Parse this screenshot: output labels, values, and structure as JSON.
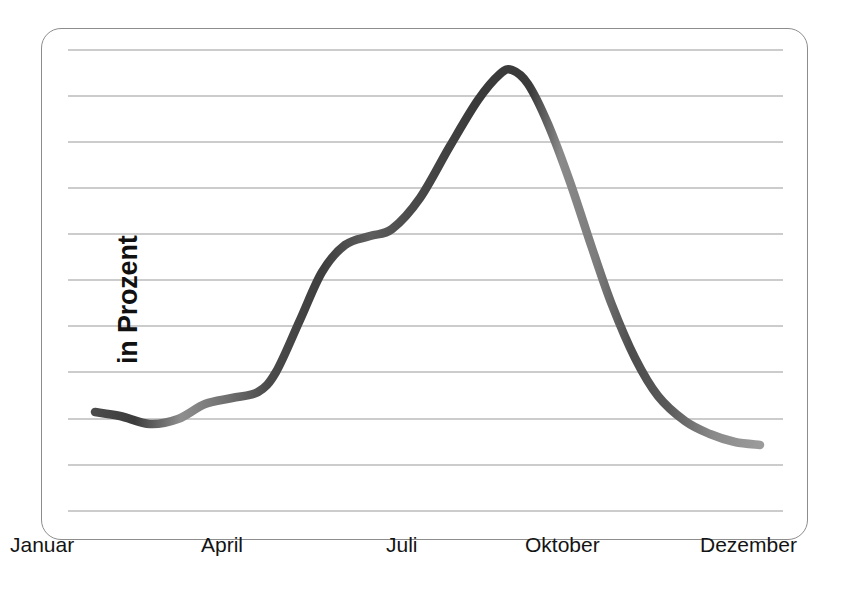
{
  "chart_data": {
    "type": "line",
    "title": "",
    "subtitle": "",
    "xlabel": "",
    "ylabel": "in Prozent",
    "grid": true,
    "gridlines": 11,
    "legend": "none",
    "annotations": [],
    "x_tick_labels": [
      "Januar",
      "April",
      "Juli",
      "Oktober",
      "Dezember"
    ],
    "x_tick_positions_px": [
      38,
      228,
      408,
      570,
      745
    ],
    "y_tick_labels": [],
    "ylim": [
      0,
      11
    ],
    "xlim": [
      "Januar",
      "Dezember"
    ],
    "series": [
      {
        "name": "Verlauf",
        "x": [
          "Januar",
          "Februar",
          "Maerz",
          "April",
          "Mai",
          "Juni",
          "Juli",
          "August",
          "September",
          "Oktober",
          "November",
          "Dezember"
        ],
        "values": [
          2.2,
          1.9,
          2.2,
          2.5,
          3.6,
          5.6,
          6.4,
          7.1,
          9.7,
          8.1,
          3.4,
          1.4
        ],
        "style": "smooth-thick-tapered",
        "color_start": "#3c3c3c",
        "color_end": "#8e8e8e"
      }
    ],
    "curve_points_px": [
      [
        95,
        412
      ],
      [
        120,
        416
      ],
      [
        150,
        424
      ],
      [
        178,
        419
      ],
      [
        205,
        404
      ],
      [
        232,
        398
      ],
      [
        258,
        392
      ],
      [
        276,
        372
      ],
      [
        300,
        320
      ],
      [
        322,
        272
      ],
      [
        345,
        245
      ],
      [
        370,
        236
      ],
      [
        392,
        229
      ],
      [
        420,
        198
      ],
      [
        450,
        146
      ],
      [
        478,
        100
      ],
      [
        500,
        74
      ],
      [
        512,
        70
      ],
      [
        528,
        84
      ],
      [
        548,
        124
      ],
      [
        570,
        182
      ],
      [
        592,
        248
      ],
      [
        612,
        305
      ],
      [
        635,
        358
      ],
      [
        658,
        396
      ],
      [
        685,
        421
      ],
      [
        710,
        434
      ],
      [
        735,
        442
      ],
      [
        760,
        445
      ]
    ]
  },
  "style": {
    "frame_border_color": "#8d8d8d",
    "gridline_color": "#9a9a9a",
    "background": "#ffffff",
    "text_color": "#141414",
    "curve_dark": "#3c3c3c",
    "curve_light": "#8e8e8e"
  },
  "axis": {
    "y_caption": "in Prozent",
    "x_ticks": [
      {
        "label": "Januar",
        "x": 10
      },
      {
        "label": "April",
        "x": 201
      },
      {
        "label": "Juli",
        "x": 386
      },
      {
        "label": "Oktober",
        "x": 525
      },
      {
        "label": "Dezember",
        "x": 700
      }
    ]
  },
  "grid": {
    "y_positions": [
      50,
      96,
      142,
      188,
      234,
      280,
      326,
      372,
      419,
      465,
      511
    ],
    "x_start": 68,
    "x_end": 783
  }
}
